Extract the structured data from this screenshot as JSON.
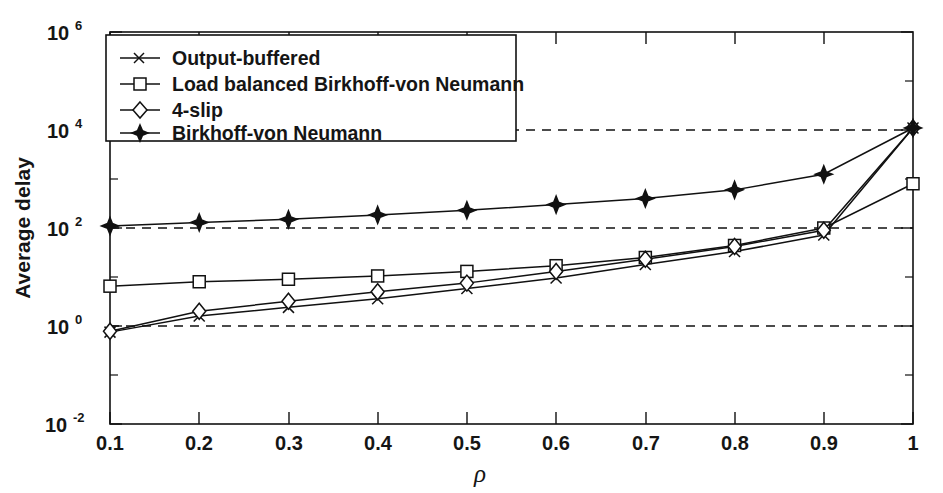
{
  "chart_data": {
    "type": "line",
    "title": "",
    "subtitle": "",
    "xlabel": "ρ",
    "ylabel": "Average delay",
    "xscale": "linear",
    "yscale": "log",
    "xlim": [
      0.1,
      1.0
    ],
    "ylim": [
      0.01,
      1000000
    ],
    "grid": "horizontal dashed at 1e0, 1e2, 1e4",
    "legend_position": "upper-left inside axes",
    "x_tick_labels": [
      "0.1",
      "0.2",
      "0.3",
      "0.4",
      "0.5",
      "0.6",
      "0.7",
      "0.8",
      "0.9",
      "1"
    ],
    "x_ticks": [
      0.1,
      0.2,
      0.3,
      0.4,
      0.5,
      0.6,
      0.7,
      0.8,
      0.9,
      1.0
    ],
    "y_tick_labels": [
      "10-2",
      "100",
      "102",
      "104",
      "106"
    ],
    "y_tick_mantissa": [
      "10",
      "10",
      "10",
      "10",
      "10"
    ],
    "y_tick_exponents": [
      "-2",
      "0",
      "2",
      "4",
      "6"
    ],
    "y_ticks": [
      0.01,
      1,
      100,
      10000,
      1000000
    ],
    "y_minor_ticks": [
      0.1,
      10,
      1000,
      100000
    ],
    "x": [
      0.1,
      0.2,
      0.3,
      0.4,
      0.5,
      0.6,
      0.7,
      0.8,
      0.9,
      1.0
    ],
    "series": [
      {
        "name": "Output-buffered",
        "marker": "x",
        "marker_style": "cross",
        "values": [
          0.75,
          1.6,
          2.4,
          3.6,
          5.8,
          9.5,
          18.0,
          33.0,
          72.0,
          11000.0
        ]
      },
      {
        "name": "Load balanced Birkhoff-von Neumann",
        "marker": "square",
        "marker_style": "open-square",
        "values": [
          6.5,
          8.0,
          9.0,
          10.5,
          13.0,
          17.0,
          25.0,
          44.0,
          100.0,
          800.0
        ]
      },
      {
        "name": "4-slip",
        "marker": "diamond",
        "marker_style": "open-diamond",
        "values": [
          0.78,
          2.0,
          3.2,
          5.0,
          7.5,
          13.0,
          23.0,
          42.0,
          90.0,
          11000.0
        ]
      },
      {
        "name": "Birkhoff-von Neumann",
        "marker": "star",
        "marker_style": "filled-star",
        "values": [
          110.0,
          130.0,
          150.0,
          185.0,
          230.0,
          300.0,
          400.0,
          600.0,
          1250.0,
          11000.0
        ]
      }
    ]
  },
  "legend": {
    "entries": [
      {
        "label": "Output-buffered",
        "marker": "cross-marker-icon"
      },
      {
        "label": "Load balanced Birkhoff-von Neumann",
        "marker": "square-marker-icon"
      },
      {
        "label": "4-slip",
        "marker": "diamond-marker-icon"
      },
      {
        "label": "Birkhoff-von Neumann",
        "marker": "star-marker-icon"
      }
    ]
  },
  "colors": {
    "ink": "#111111",
    "background": "#ffffff",
    "grid": "#111111"
  }
}
